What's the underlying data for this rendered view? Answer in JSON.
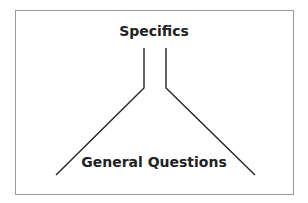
{
  "diagram": {
    "top_label": "Specifics",
    "bottom_label": "General Questions",
    "line_color": "#222222",
    "border_color": "#9a9a9a"
  }
}
